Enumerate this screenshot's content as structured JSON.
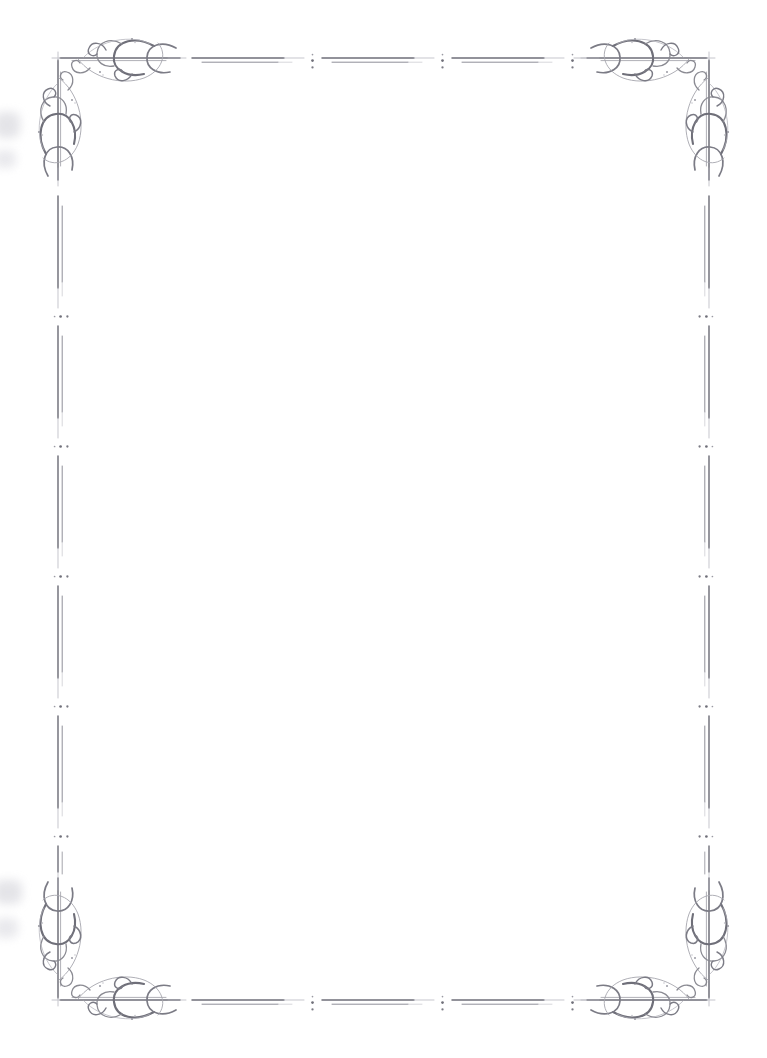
{
  "document": {
    "kind": "ornamental-page-border",
    "title": "Decorative Victorian Flourish Frame",
    "width": 767,
    "height": 1058,
    "background_color": "#ffffff",
    "body_text": "",
    "interior_is_blank": true
  },
  "style": {
    "ink_color": "#8a8a92",
    "ink_color_dark": "#6f6f79",
    "ink_color_light": "#b4b4bc",
    "ink_color_faint": "#d2d2d8",
    "smudge_color": "#dcdce1",
    "paper_color": "#ffffff"
  },
  "frame": {
    "inset_left": 58,
    "inset_top": 58,
    "inset_right": 709,
    "inset_bottom": 1000,
    "corners": [
      {
        "id": "top-left",
        "name": "corner-flourish-top-left",
        "x": 58,
        "y": 58,
        "flip_x": 1,
        "flip_y": 1
      },
      {
        "id": "top-right",
        "name": "corner-flourish-top-right",
        "x": 709,
        "y": 58,
        "flip_x": -1,
        "flip_y": 1
      },
      {
        "id": "bottom-left",
        "name": "corner-flourish-bottom-left",
        "x": 58,
        "y": 1000,
        "flip_x": 1,
        "flip_y": -1
      },
      {
        "id": "bottom-right",
        "name": "corner-flourish-bottom-right",
        "x": 709,
        "y": 1000,
        "flip_x": -1,
        "flip_y": -1
      }
    ],
    "edges": [
      {
        "id": "top",
        "name": "border-rule-top",
        "orientation": "horizontal",
        "segments": 3
      },
      {
        "id": "bottom",
        "name": "border-rule-bottom",
        "orientation": "horizontal",
        "segments": 3
      },
      {
        "id": "left",
        "name": "border-rule-left",
        "orientation": "vertical",
        "segments": 5
      },
      {
        "id": "right",
        "name": "border-rule-right",
        "orientation": "vertical",
        "segments": 5
      }
    ],
    "separator": {
      "name": "dot-cluster-separator",
      "description": "three graduated dots forming a colon-like divider between rule segments",
      "dot_count": 3
    }
  },
  "artifacts": {
    "smudges": [
      {
        "name": "edge-smudge-upper-left",
        "x": 0,
        "y": 112,
        "width": 26,
        "height": 34
      },
      {
        "name": "edge-smudge-mid-left",
        "x": 0,
        "y": 150,
        "width": 22,
        "height": 22
      },
      {
        "name": "edge-smudge-lower-left",
        "x": 0,
        "y": 880,
        "width": 28,
        "height": 30
      },
      {
        "name": "edge-smudge-bottom-left",
        "x": 0,
        "y": 918,
        "width": 24,
        "height": 26
      }
    ]
  }
}
